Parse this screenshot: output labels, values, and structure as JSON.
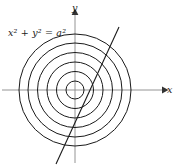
{
  "figure": {
    "background_color": "#ffffff",
    "stroke_color": "#1a1a1a",
    "axis_color": "#777777",
    "equation_label": "x² + y² = a²",
    "axes": {
      "x_label": "x",
      "y_label": "y",
      "origin": {
        "x": 75,
        "y": 90
      },
      "x_axis": {
        "x1": 2,
        "y1": 90,
        "x2": 166,
        "y2": 90,
        "arrow": "right"
      },
      "y_axis": {
        "x1": 75,
        "y1": 162,
        "x2": 75,
        "y2": 11,
        "arrow": "up"
      }
    },
    "circles": {
      "count": 6,
      "center": {
        "x": 75,
        "y": 90
      },
      "radii": [
        9,
        18.5,
        28,
        37.5,
        47,
        56
      ],
      "stroke_width": 1.0,
      "fill": "none"
    },
    "line": {
      "description": "diagonal line through origin",
      "x1": 119,
      "y1": 27,
      "x2": 56,
      "y2": 164,
      "stroke_width": 1.1
    }
  }
}
